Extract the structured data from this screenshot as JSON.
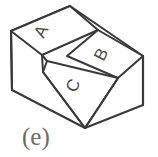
{
  "figure": {
    "kind": "isometric-solid-drawing",
    "caption": "(e)",
    "stroke_color": "#3a3a3a",
    "label_color": "#4a4a4a",
    "caption_color": "#6b6b6b",
    "background_color": "#ffffff",
    "face_labels": [
      {
        "id": "A",
        "text": "A",
        "x": 46,
        "y": 34,
        "rotation": -65
      },
      {
        "id": "B",
        "text": "B",
        "x": 104,
        "y": 58,
        "rotation": -65
      },
      {
        "id": "C",
        "text": "C",
        "x": 76,
        "y": 86,
        "rotation": -65
      }
    ],
    "edges": {
      "outline": "M 11,31 L 70,6 L 143,56 L 143,105 L 85,128 L 12,90 Z",
      "top_left_face": "M 11,31 L 70,6 L 98,30 L 42,55 Z",
      "step_riser": "M 42,55 L 98,30 L 118,78 L 63,99",
      "top_right_face": "M 98,30 L 143,56 L 118,78",
      "slot_left_edge": "M 42,55 L 47,61 L 85,128",
      "slot_inner_edge": "M 47,61 L 118,78",
      "vertical_left": "M 11,31 L 12,90",
      "vertical_right": "M 143,56 L 143,105",
      "slot_bottom_right": "M 118,78 L 85,128"
    }
  }
}
